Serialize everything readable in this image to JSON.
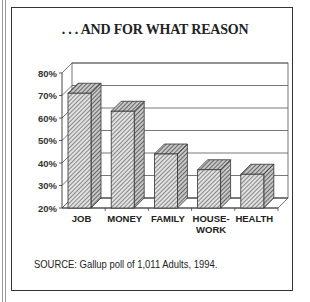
{
  "title": ". . . AND FOR WHAT REASON",
  "source": "SOURCE: Gallup poll of 1,011 Adults, 1994.",
  "colors": {
    "bar_fill": "#d0d0d0",
    "hatch": "#555555",
    "frame": "#333333",
    "grid": "#555555"
  },
  "chart_data": {
    "type": "bar",
    "title": ". . . AND FOR WHAT REASON",
    "style": "3d-hatched",
    "categories": [
      "JOB",
      "MONEY",
      "FAMILY",
      "HOUSE-WORK",
      "HEALTH"
    ],
    "category_labels": [
      [
        "JOB"
      ],
      [
        "MONEY"
      ],
      [
        "FAMILY"
      ],
      [
        "HOUSE-",
        "WORK"
      ],
      [
        "HEALTH"
      ]
    ],
    "values": [
      71,
      63,
      44,
      37,
      35
    ],
    "value_unit": "%",
    "xlabel": "",
    "ylabel": "",
    "ylim": [
      20,
      80
    ],
    "yticks": [
      "80%",
      "70%",
      "60%",
      "50%",
      "40%",
      "30%",
      "20%"
    ],
    "grid": true,
    "legend": "none",
    "annotation": "SOURCE: Gallup poll of 1,011 Adults, 1994."
  }
}
